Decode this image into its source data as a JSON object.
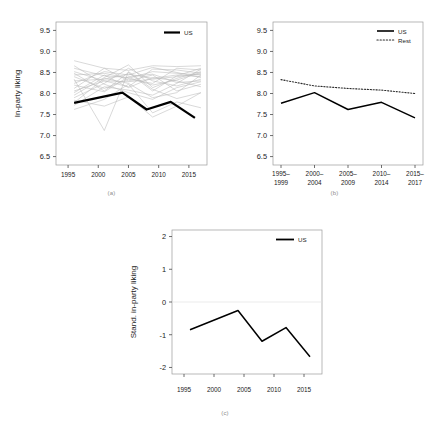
{
  "figure": {
    "caption": "",
    "panels": [
      {
        "key": "a",
        "label": "(a)"
      },
      {
        "key": "b",
        "label": "(b)"
      },
      {
        "key": "c",
        "label": "(c)"
      }
    ]
  },
  "chart_data": [
    {
      "panel": "(a)",
      "type": "line",
      "title": "",
      "xlabel": "",
      "ylabel": "In-party liking",
      "xlim": [
        1993,
        2018
      ],
      "ylim": [
        6.3,
        9.7
      ],
      "xticks": [
        1995,
        2000,
        2005,
        2010,
        2015
      ],
      "xticklabels": [
        "1995",
        "2000",
        "2005",
        "2010",
        "2015"
      ],
      "yticks": [
        6.5,
        7.0,
        7.5,
        8.0,
        8.5,
        9.0,
        9.5
      ],
      "yticklabels": [
        "6.5",
        "7.0",
        "7.5",
        "8.0",
        "8.5",
        "9.0",
        "9.5"
      ],
      "grid": false,
      "legend": {
        "position": "top-right",
        "entries": [
          {
            "name": "US",
            "style": "solid-bold",
            "color": "#000000"
          }
        ]
      },
      "series": [
        {
          "name": "US",
          "highlight": true,
          "x": [
            1996,
            2004,
            2008,
            2012,
            2016
          ],
          "values": [
            7.78,
            8.02,
            7.62,
            7.8,
            7.42
          ]
        },
        {
          "name": "other-01",
          "highlight": false,
          "x": [
            1996,
            2001,
            2005,
            2009,
            2013,
            2017
          ],
          "values": [
            8.78,
            8.6,
            8.55,
            8.66,
            8.64,
            8.66
          ]
        },
        {
          "name": "other-02",
          "highlight": false,
          "x": [
            1996,
            2001,
            2005,
            2009,
            2013,
            2017
          ],
          "values": [
            8.6,
            8.42,
            8.38,
            8.2,
            8.32,
            8.5
          ]
        },
        {
          "name": "other-03",
          "highlight": false,
          "x": [
            1996,
            2001,
            2005,
            2009,
            2013,
            2017
          ],
          "values": [
            8.3,
            8.34,
            8.46,
            8.36,
            8.44,
            8.4
          ]
        },
        {
          "name": "other-04",
          "highlight": false,
          "x": [
            1996,
            2001,
            2005,
            2009,
            2013,
            2017
          ],
          "values": [
            8.06,
            8.3,
            8.28,
            8.34,
            8.4,
            8.46
          ]
        },
        {
          "name": "other-05",
          "highlight": false,
          "x": [
            1996,
            2001,
            2005,
            2009,
            2013,
            2017
          ],
          "values": [
            7.9,
            8.24,
            8.6,
            8.3,
            8.18,
            8.34
          ]
        },
        {
          "name": "other-06",
          "highlight": false,
          "x": [
            1996,
            2001,
            2005,
            2009,
            2013,
            2017
          ],
          "values": [
            8.34,
            7.12,
            8.52,
            8.1,
            7.88,
            8.02
          ]
        },
        {
          "name": "other-07",
          "highlight": false,
          "x": [
            1996,
            2001,
            2005,
            2009,
            2013,
            2017
          ],
          "values": [
            7.72,
            8.16,
            8.08,
            7.96,
            8.24,
            8.58
          ]
        },
        {
          "name": "other-08",
          "highlight": false,
          "x": [
            1996,
            2001,
            2005,
            2009,
            2013,
            2017
          ],
          "values": [
            8.44,
            8.48,
            8.36,
            8.52,
            8.48,
            8.44
          ]
        },
        {
          "name": "other-09",
          "highlight": false,
          "x": [
            1996,
            2001,
            2005,
            2009,
            2013,
            2017
          ],
          "values": [
            8.2,
            8.04,
            8.4,
            8.46,
            8.26,
            8.3
          ]
        },
        {
          "name": "other-10",
          "highlight": false,
          "x": [
            1996,
            2001,
            2005,
            2009,
            2013,
            2017
          ],
          "values": [
            7.62,
            7.86,
            8.22,
            7.54,
            7.8,
            7.66
          ]
        },
        {
          "name": "other-11",
          "highlight": false,
          "x": [
            1996,
            2001,
            2005,
            2009,
            2013,
            2017
          ],
          "values": [
            8.52,
            8.3,
            8.16,
            8.58,
            8.56,
            8.48
          ]
        },
        {
          "name": "other-12",
          "highlight": false,
          "x": [
            1996,
            2001,
            2005,
            2009,
            2013,
            2017
          ],
          "values": [
            7.96,
            8.38,
            8.68,
            8.14,
            8.36,
            8.52
          ]
        },
        {
          "name": "other-13",
          "highlight": false,
          "x": [
            1996,
            2001,
            2005,
            2009,
            2013,
            2017
          ],
          "values": [
            8.12,
            8.6,
            8.3,
            8.44,
            8.06,
            8.22
          ]
        },
        {
          "name": "other-14",
          "highlight": false,
          "x": [
            1996,
            2001,
            2005,
            2009,
            2013,
            2017
          ],
          "values": [
            8.66,
            8.22,
            8.02,
            7.86,
            8.14,
            8.28
          ]
        },
        {
          "name": "other-15",
          "highlight": false,
          "x": [
            1996,
            2001,
            2005,
            2009,
            2013,
            2017
          ],
          "values": [
            8.24,
            8.52,
            8.44,
            8.62,
            8.5,
            8.38
          ]
        },
        {
          "name": "other-16",
          "highlight": false,
          "x": [
            1996,
            2001,
            2005,
            2009,
            2013,
            2017
          ],
          "values": [
            7.84,
            7.7,
            7.92,
            7.44,
            7.7,
            8.02
          ]
        },
        {
          "name": "other-17",
          "highlight": false,
          "x": [
            1996,
            2001,
            2005,
            2009,
            2013,
            2017
          ],
          "values": [
            8.4,
            8.12,
            8.34,
            8.24,
            8.6,
            8.56
          ]
        },
        {
          "name": "other-18",
          "highlight": false,
          "x": [
            1996,
            2001,
            2005,
            2009,
            2013,
            2017
          ],
          "values": [
            8.02,
            8.44,
            8.14,
            8.38,
            8.3,
            8.16
          ]
        },
        {
          "name": "other-19",
          "highlight": false,
          "x": [
            1996,
            2001,
            2005,
            2009,
            2013,
            2017
          ],
          "values": [
            8.48,
            8.06,
            8.5,
            8.06,
            8.42,
            8.6
          ]
        },
        {
          "name": "other-20",
          "highlight": false,
          "x": [
            1996,
            2001,
            2005,
            2009,
            2013,
            2017
          ],
          "values": [
            7.78,
            8.36,
            8.24,
            7.9,
            8.02,
            8.44
          ]
        }
      ]
    },
    {
      "panel": "(b)",
      "type": "line",
      "title": "",
      "xlabel": "",
      "ylabel": "",
      "ylim": [
        6.3,
        9.7
      ],
      "categories": [
        "1995–\n1999",
        "2000–\n2004",
        "2005–\n2009",
        "2010–\n2014",
        "2015–\n2017"
      ],
      "xticklabels_line1": [
        "1995–",
        "2000–",
        "2005–",
        "2010–",
        "2015–"
      ],
      "xticklabels_line2": [
        "1999",
        "2004",
        "2009",
        "2014",
        "2017"
      ],
      "yticks": [
        6.5,
        7.0,
        7.5,
        8.0,
        8.5,
        9.0,
        9.5
      ],
      "yticklabels": [
        "6.5",
        "7.0",
        "7.5",
        "8.0",
        "8.5",
        "9.0",
        "9.5"
      ],
      "grid": false,
      "legend": {
        "position": "top-right",
        "entries": [
          {
            "name": "US",
            "style": "solid",
            "color": "#000000"
          },
          {
            "name": "Rest",
            "style": "dotted",
            "color": "#2b2b2b"
          }
        ]
      },
      "series": [
        {
          "name": "US",
          "values": [
            7.77,
            8.02,
            7.62,
            7.79,
            7.42
          ]
        },
        {
          "name": "Rest",
          "values": [
            8.33,
            8.18,
            8.12,
            8.08,
            8.0
          ]
        }
      ]
    },
    {
      "panel": "(c)",
      "type": "line",
      "title": "",
      "xlabel": "",
      "ylabel": "Stand. in-party liking",
      "xlim": [
        1993,
        2018
      ],
      "ylim": [
        -2.2,
        2.2
      ],
      "xticks": [
        1995,
        2000,
        2005,
        2010,
        2015
      ],
      "xticklabels": [
        "1995",
        "2000",
        "2005",
        "2010",
        "2015"
      ],
      "yticks": [
        -2,
        -1,
        0,
        1,
        2
      ],
      "yticklabels": [
        "-2",
        "-1",
        "0",
        "1",
        "2"
      ],
      "grid": false,
      "zeroline": true,
      "legend": {
        "position": "top-right",
        "entries": [
          {
            "name": "US",
            "style": "solid",
            "color": "#000000"
          }
        ]
      },
      "series": [
        {
          "name": "US",
          "x": [
            1996,
            2004,
            2008,
            2012,
            2016
          ],
          "values": [
            -0.85,
            -0.26,
            -1.2,
            -0.78,
            -1.67
          ]
        }
      ]
    }
  ]
}
